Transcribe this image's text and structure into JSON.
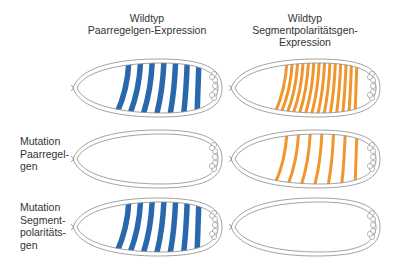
{
  "columns": [
    {
      "id": "pair-rule",
      "title_lines": [
        "Wildtyp",
        "Paarregelgen-Expression"
      ]
    },
    {
      "id": "segment-polarity",
      "title_lines": [
        "Wildtyp",
        "Segmentpolaritätsgen-",
        "Expression"
      ]
    }
  ],
  "rows": [
    {
      "id": "wildtype",
      "label_lines": []
    },
    {
      "id": "pair-rule-mutant",
      "label_lines": [
        "Mutation",
        "Paarregel-",
        "gen"
      ]
    },
    {
      "id": "segment-polarity-mutant",
      "label_lines": [
        "Mutation",
        "Segment-",
        "polaritäts-",
        "gen"
      ]
    }
  ],
  "colors": {
    "pair_rule_stripe": "#2a68ad",
    "segment_polarity_stripe": "#f0962e",
    "outline": "#8a8a8a"
  },
  "embryos": [
    {
      "row": 0,
      "col": 0,
      "stripe_type": "pair_rule",
      "stripe_count": 7,
      "stripe_style": "thick"
    },
    {
      "row": 0,
      "col": 1,
      "stripe_type": "segment_polarity",
      "stripe_count": 14,
      "stripe_style": "thin"
    },
    {
      "row": 1,
      "col": 0,
      "stripe_type": "none",
      "stripe_count": 0,
      "stripe_style": "none"
    },
    {
      "row": 1,
      "col": 1,
      "stripe_type": "segment_polarity",
      "stripe_count": 7,
      "stripe_style": "thin"
    },
    {
      "row": 2,
      "col": 0,
      "stripe_type": "pair_rule",
      "stripe_count": 7,
      "stripe_style": "thick"
    },
    {
      "row": 2,
      "col": 1,
      "stripe_type": "none",
      "stripe_count": 0,
      "stripe_style": "none"
    }
  ]
}
